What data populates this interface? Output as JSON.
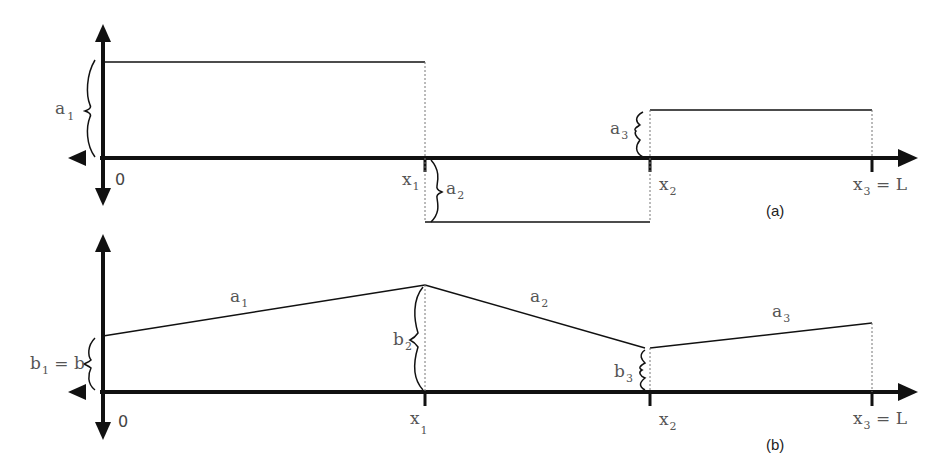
{
  "panels": [
    {
      "id": "a",
      "caption": "(a)",
      "origin_label": "0",
      "x_ticks": [
        {
          "label": "x",
          "sub": "1",
          "suffix": ""
        },
        {
          "label": "x",
          "sub": "2",
          "suffix": ""
        },
        {
          "label": "x",
          "sub": "3",
          "suffix": " = L"
        }
      ],
      "segments": [
        {
          "label": "a",
          "sub": "1",
          "kind": "constant",
          "sign": "positive"
        },
        {
          "label": "a",
          "sub": "2",
          "kind": "constant",
          "sign": "negative"
        },
        {
          "label": "a",
          "sub": "3",
          "kind": "constant",
          "sign": "positive"
        }
      ]
    },
    {
      "id": "b",
      "caption": "(b)",
      "origin_label": "0",
      "x_ticks": [
        {
          "label": "x",
          "sub": "1",
          "suffix": ""
        },
        {
          "label": "x",
          "sub": "2",
          "suffix": ""
        },
        {
          "label": "x",
          "sub": "3",
          "suffix": " = L"
        }
      ],
      "slopes": [
        {
          "label": "a",
          "sub": "1"
        },
        {
          "label": "a",
          "sub": "2"
        },
        {
          "label": "a",
          "sub": "3"
        }
      ],
      "intercepts": [
        {
          "label": "b",
          "sub": "1",
          "suffix": " = b"
        },
        {
          "label": "b",
          "sub": "2",
          "suffix": ""
        },
        {
          "label": "b",
          "sub": "3",
          "suffix": ""
        }
      ]
    }
  ]
}
